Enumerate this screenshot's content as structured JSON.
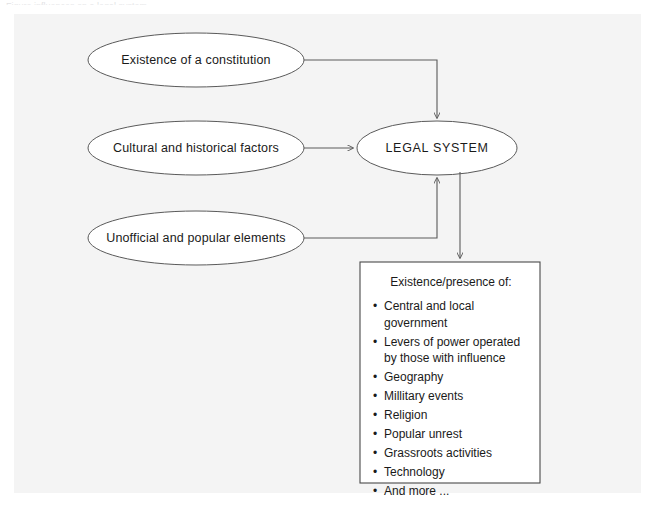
{
  "figure": {
    "cut_caption": "Figure   influences on a legal system"
  },
  "diagram": {
    "inputs": [
      {
        "id": "constitution",
        "label": "Existence of a constitution"
      },
      {
        "id": "cultural",
        "label": "Cultural and historical factors"
      },
      {
        "id": "unofficial",
        "label": "Unofficial and popular elements"
      }
    ],
    "center": {
      "id": "legal-system",
      "label": "LEGAL SYSTEM"
    },
    "outcome_box": {
      "title": "Existence/presence of:",
      "bullet_char": "•",
      "items": [
        "Central and local government",
        "Levers of power operated by those with influence",
        "Geography",
        "Millitary events",
        "Religion",
        "Popular unrest",
        "Grassroots activities",
        "Technology",
        "And more ..."
      ]
    },
    "colors": {
      "stroke": "#5a5a5a",
      "box_stroke": "#4a4a4a",
      "text": "#1a1a1a",
      "plate": "#f4f4f4",
      "page": "#ffffff"
    }
  }
}
